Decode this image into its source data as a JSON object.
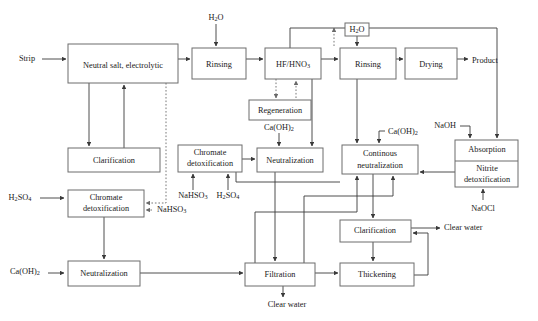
{
  "diagram": {
    "type": "process-flow-diagram",
    "colors": {
      "background": "#ffffff",
      "box_stroke": "#6d6d6d",
      "solid_line": "#3a3a3a",
      "dotted_line": "#6a6a6a",
      "text": "#1a1a1a"
    },
    "process_boxes": [
      {
        "id": "neutral_salt",
        "label": "Neutral salt, electrolytic",
        "x": 68,
        "y": 44,
        "w": 110,
        "h": 39
      },
      {
        "id": "rinsing_1",
        "label": "Rinsing",
        "x": 192,
        "y": 48,
        "w": 54,
        "h": 31
      },
      {
        "id": "hf_hno3",
        "label": "HF/HNO3",
        "x": 265,
        "y": 48,
        "w": 56,
        "h": 31
      },
      {
        "id": "rinsing_2",
        "label": "Rinsing",
        "x": 340,
        "y": 48,
        "w": 56,
        "h": 31
      },
      {
        "id": "drying",
        "label": "Drying",
        "x": 405,
        "y": 48,
        "w": 52,
        "h": 31
      },
      {
        "id": "regeneration",
        "label": "Regeneration",
        "x": 249,
        "y": 100,
        "w": 62,
        "h": 20
      },
      {
        "id": "clarification_top",
        "label": "Clarification",
        "x": 68,
        "y": 148,
        "w": 92,
        "h": 24
      },
      {
        "id": "chromate_detox_mid",
        "label": "Chromate\ndetoxification",
        "x": 178,
        "y": 145,
        "w": 64,
        "h": 27
      },
      {
        "id": "neutralization_mid",
        "label": "Neutralization",
        "x": 257,
        "y": 148,
        "w": 66,
        "h": 24
      },
      {
        "id": "continous_neutral",
        "label": "Continous\nneutralization",
        "x": 342,
        "y": 145,
        "w": 76,
        "h": 29
      },
      {
        "id": "absorption",
        "label": "Absorption",
        "x": 455,
        "y": 140,
        "w": 63,
        "h": 21
      },
      {
        "id": "nitrite_detox",
        "label": "Nitrite\ndetoxification",
        "x": 455,
        "y": 161,
        "w": 63,
        "h": 26
      },
      {
        "id": "chromate_detox_low",
        "label": "Chromate\ndetoxification",
        "x": 68,
        "y": 190,
        "w": 76,
        "h": 27
      },
      {
        "id": "neutralization_low",
        "label": "Neutralization",
        "x": 68,
        "y": 261,
        "w": 72,
        "h": 25
      },
      {
        "id": "filtration",
        "label": "Filtration",
        "x": 245,
        "y": 263,
        "w": 70,
        "h": 23
      },
      {
        "id": "clarification_bot",
        "label": "Clarification",
        "x": 340,
        "y": 220,
        "w": 71,
        "h": 22
      },
      {
        "id": "thickening",
        "label": "Thickening",
        "x": 340,
        "y": 263,
        "w": 74,
        "h": 23
      },
      {
        "id": "h2o_boxed",
        "label": "H2O",
        "x": 345,
        "y": 23,
        "w": 24,
        "h": 13
      }
    ],
    "stream_labels": [
      {
        "id": "strip",
        "text": "Strip",
        "x": 27,
        "y": 59
      },
      {
        "id": "h2o_top",
        "text": "H2O",
        "x": 216,
        "y": 18
      },
      {
        "id": "h2o_boxed_lbl",
        "text": "H2O",
        "x": 357,
        "y": 29
      },
      {
        "id": "product",
        "text": "Product",
        "x": 482,
        "y": 61
      },
      {
        "id": "caoh2_regen",
        "text": "Ca(OH)2",
        "x": 279,
        "y": 128
      },
      {
        "id": "caoh2_cont",
        "text": "Ca(OH)2",
        "x": 400,
        "y": 132
      },
      {
        "id": "naoh",
        "text": "NaOH",
        "x": 440,
        "y": 126
      },
      {
        "id": "naocl",
        "text": "NaOCl",
        "x": 483,
        "y": 208
      },
      {
        "id": "nahso3_mid",
        "text": "NaHSO3",
        "x": 193,
        "y": 196
      },
      {
        "id": "h2so4_mid",
        "text": "H2SO4",
        "x": 228,
        "y": 196
      },
      {
        "id": "nahso3_low",
        "text": "NaHSO3",
        "x": 176,
        "y": 213
      },
      {
        "id": "h2so4_low",
        "text": "H2SO4",
        "x": 20,
        "y": 198
      },
      {
        "id": "caoh2_low",
        "text": "Ca(OH)2",
        "x": 25,
        "y": 271
      },
      {
        "id": "clear_water_filtration",
        "text": "Clear water",
        "x": 287,
        "y": 305
      },
      {
        "id": "clear_water_clarification",
        "text": "Clear water",
        "x": 470,
        "y": 228
      }
    ],
    "connections": [
      {
        "from": "strip",
        "to": "neutral_salt",
        "style": "solid"
      },
      {
        "from": "neutral_salt",
        "to": "rinsing_1",
        "style": "solid"
      },
      {
        "from": "rinsing_1",
        "to": "hf_hno3",
        "style": "solid"
      },
      {
        "from": "hf_hno3",
        "to": "rinsing_2",
        "style": "solid"
      },
      {
        "from": "rinsing_2",
        "to": "drying",
        "style": "solid"
      },
      {
        "from": "drying",
        "to": "product",
        "style": "solid"
      },
      {
        "from": "h2o_top",
        "to": "rinsing_1",
        "style": "solid"
      },
      {
        "from": "h2o_boxed",
        "to": "rinsing_2",
        "style": "solid"
      },
      {
        "from": "h2o_boxed",
        "to": "hf_hno3_rinse_return",
        "style": "dotted"
      },
      {
        "from": "neutral_salt",
        "to": "clarification_top",
        "style": "solid"
      },
      {
        "from": "clarification_top",
        "to": "neutral_salt",
        "style": "solid"
      },
      {
        "from": "neutral_salt",
        "to": "chromate_detox_low",
        "style": "dotted"
      },
      {
        "from": "hf_hno3",
        "to": "regeneration",
        "style": "dotted"
      },
      {
        "from": "regeneration",
        "to": "hf_hno3",
        "style": "dotted"
      },
      {
        "from": "regeneration",
        "to": "neutralization_mid",
        "style": "solid"
      },
      {
        "from": "hf_hno3",
        "to": "neutralization_mid",
        "style": "solid"
      },
      {
        "from": "rinsing_2",
        "to": "continous_neutral",
        "style": "solid"
      },
      {
        "from": "caoh2_cont",
        "to": "continous_neutral",
        "style": "solid"
      },
      {
        "from": "naoh",
        "to": "absorption",
        "style": "solid"
      },
      {
        "from": "hf_hno3_top_header",
        "to": "absorption",
        "style": "solid"
      },
      {
        "from": "naocl",
        "to": "nitrite_detox",
        "style": "solid"
      },
      {
        "from": "nitrite_detox",
        "to": "continous_neutral",
        "style": "solid"
      },
      {
        "from": "nahso3_mid",
        "to": "chromate_detox_mid",
        "style": "solid"
      },
      {
        "from": "h2so4_mid",
        "to": "chromate_detox_mid",
        "style": "solid"
      },
      {
        "from": "chromate_detox_mid",
        "to": "neutralization_mid",
        "style": "solid"
      },
      {
        "from": "h2so4_low",
        "to": "chromate_detox_low",
        "style": "solid"
      },
      {
        "from": "nahso3_low",
        "to": "chromate_detox_low",
        "style": "dotted"
      },
      {
        "from": "chromate_detox_low",
        "to": "neutralization_low",
        "style": "solid"
      },
      {
        "from": "caoh2_low",
        "to": "neutralization_low",
        "style": "solid"
      },
      {
        "from": "neutralization_low",
        "to": "filtration",
        "style": "solid"
      },
      {
        "from": "neutralization_mid",
        "to": "filtration",
        "style": "solid"
      },
      {
        "from": "continous_neutral",
        "to": "clarification_bot",
        "style": "solid"
      },
      {
        "from": "clarification_bot",
        "to": "thickening",
        "style": "solid"
      },
      {
        "from": "clarification_bot",
        "to": "clear_water_clarification",
        "style": "solid"
      },
      {
        "from": "thickening",
        "to": "clarification_bot",
        "style": "solid"
      },
      {
        "from": "filtration",
        "to": "thickening",
        "style": "solid"
      },
      {
        "from": "filtration",
        "to": "clear_water_filtration",
        "style": "solid"
      },
      {
        "from": "filtration",
        "to": "continous_neutral",
        "style": "solid"
      },
      {
        "from": "thickening",
        "to": "continous_neutral",
        "style": "solid"
      }
    ]
  }
}
